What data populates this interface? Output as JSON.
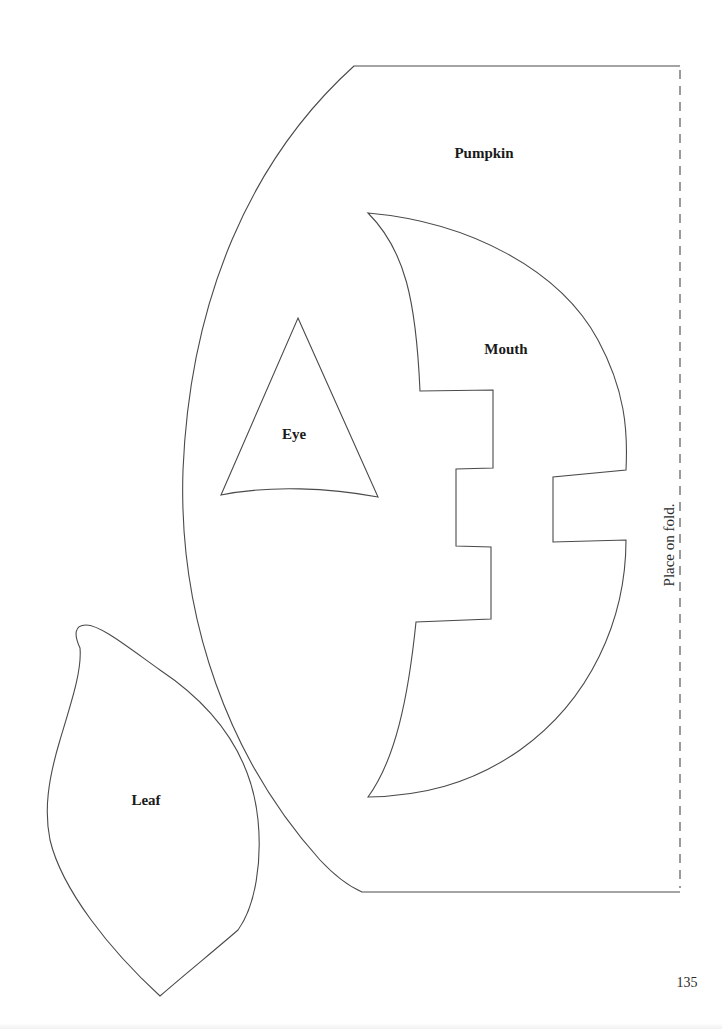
{
  "page": {
    "number": "135",
    "background_color": "#ffffff",
    "line_color": "#4a4a4a"
  },
  "pieces": {
    "pumpkin": {
      "label": "Pumpkin"
    },
    "mouth": {
      "label": "Mouth"
    },
    "eye": {
      "label": "Eye"
    },
    "leaf": {
      "label": "Leaf"
    }
  },
  "fold": {
    "instruction": "Place on fold."
  }
}
